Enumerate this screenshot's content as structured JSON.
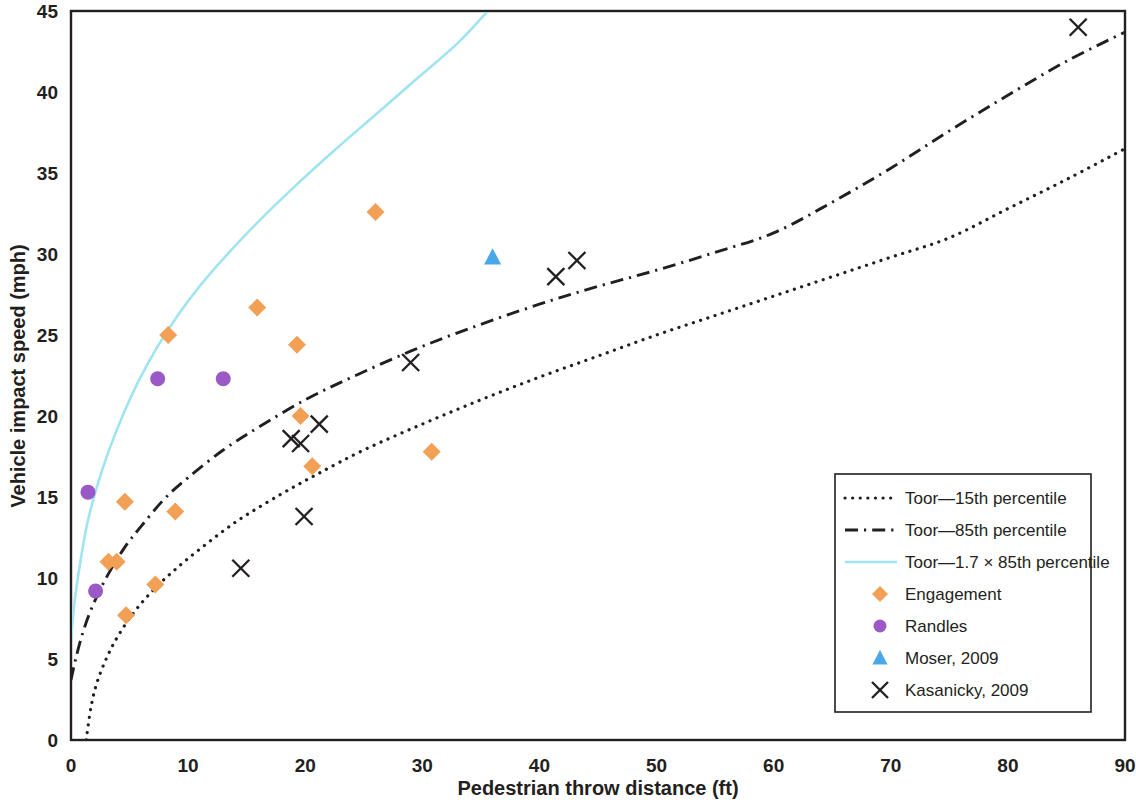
{
  "chart_data": {
    "type": "scatter",
    "title": "",
    "xlabel": "Pedestrian throw distance (ft)",
    "ylabel": "Vehicle impact speed (mph)",
    "xlim": [
      0,
      90
    ],
    "ylim": [
      0,
      45
    ],
    "xticks": [
      0,
      10,
      20,
      30,
      40,
      50,
      60,
      70,
      80,
      90
    ],
    "yticks": [
      0,
      5,
      10,
      15,
      20,
      25,
      30,
      35,
      40,
      45
    ],
    "grid": false,
    "legend_position": "lower-right",
    "series": [
      {
        "name": "Toor—15th percentile",
        "type": "line",
        "style": "dotted",
        "color": "#231f20",
        "points": [
          [
            1.3,
            0.0
          ],
          [
            1.7,
            2.0
          ],
          [
            2.2,
            3.5
          ],
          [
            3.0,
            5.0
          ],
          [
            4.0,
            6.4
          ],
          [
            5.5,
            8.0
          ],
          [
            7.5,
            9.6
          ],
          [
            10.0,
            11.2
          ],
          [
            13.0,
            12.9
          ],
          [
            15.0,
            13.9
          ],
          [
            18.0,
            15.2
          ],
          [
            21.0,
            16.4
          ],
          [
            25.0,
            17.9
          ],
          [
            30.0,
            19.5
          ],
          [
            35.0,
            21.0
          ],
          [
            40.0,
            22.4
          ],
          [
            45.0,
            23.7
          ],
          [
            50.0,
            25.0
          ],
          [
            55.0,
            26.2
          ],
          [
            60.0,
            27.4
          ],
          [
            65.0,
            28.6
          ],
          [
            70.0,
            29.8
          ],
          [
            75.0,
            31.0
          ],
          [
            80.0,
            32.8
          ],
          [
            85.0,
            34.6
          ],
          [
            90.0,
            36.5
          ]
        ]
      },
      {
        "name": "Toor—85th percentile",
        "type": "line",
        "style": "dash-dot",
        "color": "#231f20",
        "points": [
          [
            0.0,
            3.7
          ],
          [
            0.4,
            5.0
          ],
          [
            1.0,
            6.6
          ],
          [
            1.8,
            8.2
          ],
          [
            3.0,
            10.0
          ],
          [
            4.5,
            11.8
          ],
          [
            6.0,
            13.2
          ],
          [
            8.0,
            14.9
          ],
          [
            10.0,
            16.2
          ],
          [
            13.0,
            17.9
          ],
          [
            16.0,
            19.3
          ],
          [
            20.0,
            21.0
          ],
          [
            24.0,
            22.4
          ],
          [
            29.0,
            24.0
          ],
          [
            34.0,
            25.4
          ],
          [
            40.0,
            26.9
          ],
          [
            45.0,
            28.0
          ],
          [
            50.0,
            29.0
          ],
          [
            55.0,
            30.1
          ],
          [
            60.0,
            31.3
          ],
          [
            65.0,
            33.2
          ],
          [
            70.0,
            35.3
          ],
          [
            75.0,
            37.6
          ],
          [
            80.0,
            39.8
          ],
          [
            85.0,
            41.9
          ],
          [
            90.0,
            43.7
          ]
        ]
      },
      {
        "name": "Toor—1.7 × 85th percentile",
        "type": "line",
        "style": "solid",
        "color": "#9fe4f0",
        "points": [
          [
            0.0,
            6.2
          ],
          [
            0.3,
            8.5
          ],
          [
            0.8,
            11.0
          ],
          [
            1.4,
            13.4
          ],
          [
            2.2,
            15.6
          ],
          [
            3.2,
            17.8
          ],
          [
            4.4,
            20.0
          ],
          [
            5.8,
            22.2
          ],
          [
            7.4,
            24.3
          ],
          [
            9.2,
            26.3
          ],
          [
            11.2,
            28.2
          ],
          [
            13.5,
            30.1
          ],
          [
            16.0,
            32.0
          ],
          [
            19.0,
            34.1
          ],
          [
            22.5,
            36.4
          ],
          [
            26.0,
            38.6
          ],
          [
            29.5,
            40.8
          ],
          [
            33.0,
            43.0
          ],
          [
            35.6,
            45.0
          ]
        ]
      },
      {
        "name": "Engagement",
        "type": "scatter",
        "marker": "diamond",
        "color": "#f2a055",
        "points": [
          [
            3.2,
            11.0
          ],
          [
            3.9,
            11.0
          ],
          [
            4.6,
            14.7
          ],
          [
            4.7,
            7.7
          ],
          [
            7.2,
            9.6
          ],
          [
            8.3,
            25.0
          ],
          [
            8.9,
            14.1
          ],
          [
            15.9,
            26.7
          ],
          [
            19.3,
            24.4
          ],
          [
            19.6,
            20.0
          ],
          [
            20.6,
            16.9
          ],
          [
            26.0,
            32.6
          ],
          [
            30.8,
            17.8
          ]
        ]
      },
      {
        "name": "Randles",
        "type": "scatter",
        "marker": "circle",
        "color": "#9b59c7",
        "points": [
          [
            1.45,
            15.3
          ],
          [
            2.1,
            9.2
          ],
          [
            7.4,
            22.3
          ],
          [
            13.0,
            22.3
          ]
        ]
      },
      {
        "name": "Moser, 2009",
        "type": "scatter",
        "marker": "triangle",
        "color": "#4aa8e8",
        "points": [
          [
            36.0,
            29.8
          ]
        ]
      },
      {
        "name": "Kasanicky, 2009",
        "type": "scatter",
        "marker": "x",
        "color": "#231f20",
        "points": [
          [
            14.5,
            10.6
          ],
          [
            18.8,
            18.6
          ],
          [
            19.6,
            18.3
          ],
          [
            19.9,
            13.8
          ],
          [
            21.2,
            19.5
          ],
          [
            29.0,
            23.3
          ],
          [
            41.4,
            28.6
          ],
          [
            43.2,
            29.6
          ],
          [
            86.0,
            44.0
          ]
        ]
      }
    ]
  },
  "legend": {
    "entries": [
      {
        "label": "Toor—15th percentile",
        "swatch": "dotted-line-swatch"
      },
      {
        "label": "Toor—85th percentile",
        "swatch": "dashdot-line-swatch"
      },
      {
        "label": "Toor—1.7 × 85th percentile",
        "swatch": "solid-cyan-line-swatch"
      },
      {
        "label": "Engagement",
        "swatch": "orange-diamond-swatch"
      },
      {
        "label": "Randles",
        "swatch": "purple-circle-swatch"
      },
      {
        "label": "Moser, 2009",
        "swatch": "blue-triangle-swatch"
      },
      {
        "label": "Kasanicky, 2009",
        "swatch": "black-x-swatch"
      }
    ]
  },
  "colors": {
    "engagement": "#f2a055",
    "randles": "#9b59c7",
    "moser": "#4aa8e8",
    "kasanicky": "#231f20",
    "toor_17x85": "#9fe4f0",
    "axis": "#231f20"
  }
}
